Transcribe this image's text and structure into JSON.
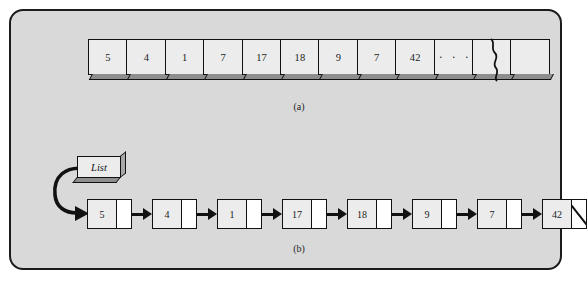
{
  "figure": {
    "panel_background": "#d9d9d9",
    "border_color": "#1c1c1c",
    "cell_fill": "#ececec",
    "pointer_fill": "#ffffff",
    "ink_color": "#111111"
  },
  "part_a": {
    "caption": "(a)",
    "kind": "array",
    "cells": [
      "5",
      "4",
      "1",
      "7",
      "17",
      "18",
      "9",
      "7",
      "42",
      "· · ·",
      "",
      ""
    ],
    "right_edge": "torn",
    "cell_count": 12
  },
  "part_b": {
    "caption": "(b)",
    "kind": "linked-list",
    "head_label": "List",
    "nodes": [
      {
        "value": "5",
        "next": "arrow"
      },
      {
        "value": "4",
        "next": "arrow"
      },
      {
        "value": "1",
        "next": "arrow"
      },
      {
        "value": "17",
        "next": "arrow"
      },
      {
        "value": "18",
        "next": "arrow"
      },
      {
        "value": "9",
        "next": "arrow"
      },
      {
        "value": "7",
        "next": "arrow"
      },
      {
        "value": "42",
        "next": "null"
      }
    ]
  }
}
